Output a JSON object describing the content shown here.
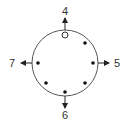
{
  "diagram": {
    "circle": {
      "cx": 65,
      "cy": 63,
      "r": 33,
      "stroke": "#555555"
    },
    "dots": [
      {
        "id": "top",
        "x": 65,
        "y": 35,
        "filled": false
      },
      {
        "id": "upper-right",
        "x": 85,
        "y": 43,
        "filled": true
      },
      {
        "id": "right",
        "x": 93,
        "y": 63,
        "filled": true
      },
      {
        "id": "lower-right",
        "x": 85,
        "y": 83,
        "filled": true
      },
      {
        "id": "bottom",
        "x": 65,
        "y": 92,
        "filled": true
      },
      {
        "id": "lower-left",
        "x": 46,
        "y": 83,
        "filled": true
      },
      {
        "id": "left",
        "x": 38,
        "y": 63,
        "filled": true
      }
    ],
    "arrows": [
      {
        "direction": "up",
        "label": "4"
      },
      {
        "direction": "right",
        "label": "5"
      },
      {
        "direction": "down",
        "label": "6"
      },
      {
        "direction": "left",
        "label": "7"
      }
    ],
    "colors": {
      "line": "#555555",
      "dot": "#111111",
      "text": "#333333"
    }
  }
}
